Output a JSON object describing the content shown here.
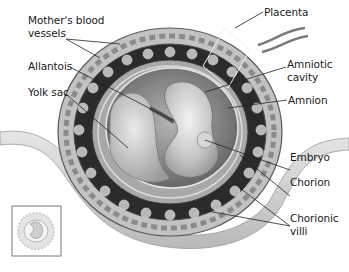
{
  "diagram": {
    "labels": {
      "mothers_blood_vessels_line1": "Mother's blood",
      "mothers_blood_vessels_line2": "vessels",
      "allantois": "Allantois",
      "yolk_sac": "Yolk sac",
      "placenta": "Placenta",
      "amniotic_cavity_line1": "Amniotic",
      "amniotic_cavity_line2": "cavity",
      "amnion": "Amnion",
      "embryo": "Embryo",
      "chorion": "Chorion",
      "chorionic_villi_line1": "Chorionic",
      "chorionic_villi_line2": "villi"
    },
    "inset": "thumbnail-of-whole-structure",
    "colors": {
      "background": "#ffffff",
      "text": "#1a1a1a",
      "leader_line": "#222222",
      "dark_layer": "#2b2b2b",
      "outer_ring": "#b8b8b8",
      "uterine_wall": "#d6d6d6",
      "cavity": "#8a8a8a",
      "embryo": "#c9c9c9",
      "inset_border": "#777777"
    }
  }
}
